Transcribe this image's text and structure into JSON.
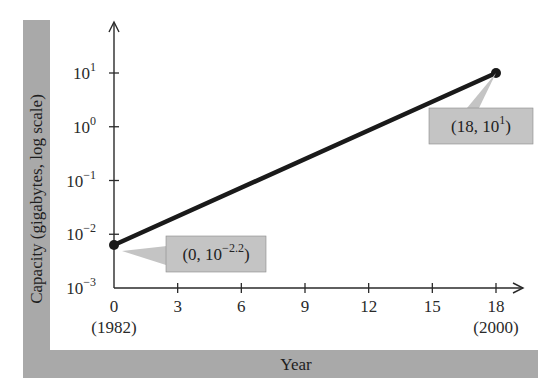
{
  "chart_data": {
    "type": "line",
    "title": "",
    "xlabel": "Year",
    "ylabel": "Capacity (gigabytes, log scale)",
    "x_ticks": [
      0,
      3,
      6,
      9,
      12,
      15,
      18
    ],
    "x_tick_sublabels": {
      "0": "(1982)",
      "18": "(2000)"
    },
    "y_scale": "log",
    "y_ticks": [
      "10^-3",
      "10^-2",
      "10^-1",
      "10^0",
      "10^1"
    ],
    "y_tick_exponents": [
      -3,
      -2,
      -1,
      0,
      1
    ],
    "xlim": [
      0,
      19
    ],
    "ylim_log10": [
      -3,
      1.9
    ],
    "grid": false,
    "series": [
      {
        "name": "Capacity",
        "x": [
          0,
          18
        ],
        "log10_y": [
          -2.2,
          1
        ],
        "y": [
          0.00631,
          10
        ]
      }
    ],
    "annotations": [
      {
        "point": [
          0,
          -2.2
        ],
        "text": "(0, 10",
        "sup": "−2.2",
        "close": ")"
      },
      {
        "point": [
          18,
          1
        ],
        "text": "(18, 10",
        "sup": "1",
        "close": ")"
      }
    ],
    "colors": {
      "line": "#1a1a1a",
      "frame": "#a9a9a9",
      "callout": "#c4c4c4"
    }
  }
}
